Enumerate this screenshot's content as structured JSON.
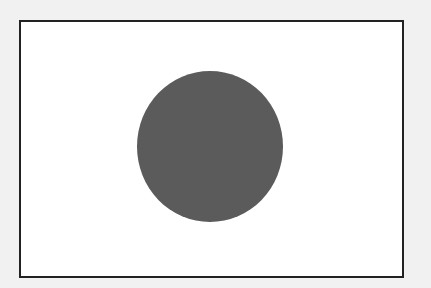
{
  "image": {
    "subject": "flag",
    "description": "White rectangular field with a dark gray centered disc, black border",
    "colors": {
      "page_background": "#f1f1f1",
      "field": "#ffffff",
      "border": "#222222",
      "disc": "#5b5b5b"
    }
  }
}
